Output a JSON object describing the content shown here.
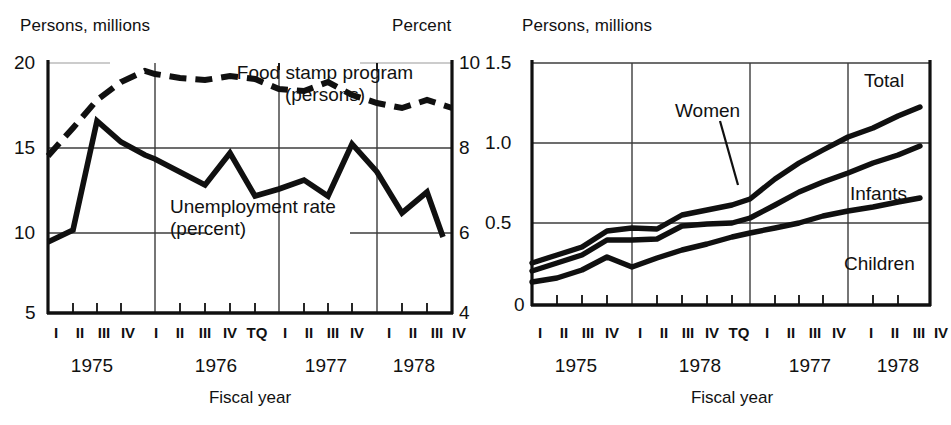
{
  "figure": {
    "background": "#ffffff",
    "ink": "#111111",
    "grid_color": "#4a4a4a"
  },
  "charts": [
    {
      "id": "food-stamp-unemployment",
      "left_axis_caption": "Persons, millions",
      "right_axis_caption": "Percent",
      "xlabel": "Fiscal year",
      "left_ticks": [
        "20",
        "15",
        "10",
        "5"
      ],
      "right_ticks": [
        "10",
        "8",
        "6",
        "4"
      ],
      "quarters": [
        "I",
        "II",
        "III",
        "IV",
        "I",
        "II",
        "III",
        "IV",
        "TQ",
        "I",
        "II",
        "III",
        "IV",
        "I",
        "II",
        "III",
        "IV"
      ],
      "years": [
        "1975",
        "1976",
        "1977",
        "1978"
      ],
      "series_labels": {
        "food_stamp_line1": "Food stamp program",
        "food_stamp_line2": "(persons)",
        "unemployment_line1": "Unemployment rate",
        "unemployment_line2": "(percent)"
      }
    },
    {
      "id": "wic-participants",
      "left_axis_caption": "Persons, millions",
      "xlabel": "Fiscal year",
      "left_ticks": [
        "1.5",
        "1.0",
        "0.5",
        "0"
      ],
      "quarters": [
        "I",
        "II",
        "III",
        "IV",
        "I",
        "II",
        "III",
        "IV",
        "TQ",
        "I",
        "II",
        "III",
        "IV",
        "I",
        "II",
        "III",
        "IV"
      ],
      "years": [
        "1975",
        "1978",
        "1977",
        "1978"
      ],
      "series_labels": {
        "total": "Total",
        "women": "Women",
        "infants": "Infants",
        "children": "Children"
      }
    }
  ],
  "chart_data": [
    {
      "type": "line",
      "title": "",
      "xlabel": "Fiscal year",
      "ylabel": "Persons, millions",
      "y2label": "Percent",
      "ylim": [
        5,
        20
      ],
      "y2lim": [
        4,
        10
      ],
      "yticks": [
        5,
        10,
        15,
        20
      ],
      "y2ticks": [
        4,
        6,
        8,
        10
      ],
      "grid": true,
      "legend": "inline-annotations",
      "x": [
        "I 1975",
        "II 1975",
        "III 1975",
        "IV 1975",
        "I 1976",
        "II 1976",
        "III 1976",
        "IV 1976",
        "TQ",
        "I 1977",
        "II 1977",
        "III 1977",
        "IV 1977",
        "I 1978",
        "II 1978",
        "III 1978",
        "IV 1978"
      ],
      "series": [
        {
          "name": "Food stamp program (persons)",
          "axis": "left",
          "units": "millions of persons",
          "style": "dashed",
          "values": [
            14.4,
            16.2,
            18.6,
            19.4,
            18.7,
            18.6,
            18.9,
            18.5,
            17.5,
            17.4,
            17.9,
            17.1,
            16.4,
            16.0,
            16.6,
            16.5,
            16.0
          ]
        },
        {
          "name": "Unemployment rate (percent)",
          "axis": "right",
          "units": "percent",
          "style": "solid",
          "values": [
            5.7,
            6.0,
            8.6,
            8.4,
            8.1,
            7.8,
            8.3,
            7.5,
            7.6,
            7.4,
            8.2,
            7.1,
            6.9,
            6.3,
            6.6,
            5.9,
            null
          ]
        }
      ]
    },
    {
      "type": "line",
      "title": "",
      "xlabel": "Fiscal year",
      "ylabel": "Persons, millions",
      "ylim": [
        0,
        1.5
      ],
      "yticks": [
        0,
        0.5,
        1.0,
        1.5
      ],
      "grid": true,
      "legend": "inline-annotations",
      "x": [
        "I 1975",
        "II 1975",
        "III 1975",
        "IV 1975",
        "I 1976",
        "II 1976",
        "III 1976",
        "IV 1976",
        "TQ",
        "I 1977",
        "II 1977",
        "III 1977",
        "IV 1977",
        "I 1978",
        "II 1978",
        "III 1978",
        "IV 1978"
      ],
      "series": [
        {
          "name": "Total",
          "units": "millions of persons",
          "style": "solid",
          "values": [
            0.26,
            0.31,
            0.36,
            0.46,
            0.48,
            0.47,
            0.56,
            0.59,
            0.62,
            0.66,
            0.78,
            0.88,
            0.96,
            1.04,
            1.1,
            1.17,
            1.23
          ]
        },
        {
          "name": "Women",
          "units": "millions of persons",
          "style": "solid",
          "values": [
            0.21,
            0.26,
            0.31,
            0.4,
            0.4,
            0.41,
            0.49,
            0.5,
            0.51,
            0.54,
            0.62,
            0.7,
            0.76,
            0.82,
            0.88,
            0.93,
            0.99
          ]
        },
        {
          "name": "Infants",
          "units": "millions of persons",
          "style": "solid",
          "values": [
            0.14,
            0.17,
            0.22,
            0.3,
            0.24,
            0.29,
            0.34,
            0.38,
            0.42,
            0.45,
            0.48,
            0.51,
            0.55,
            0.58,
            0.61,
            0.64,
            0.66
          ]
        },
        {
          "name": "Children",
          "units": "millions of persons",
          "style": "annotation-only",
          "values": []
        }
      ]
    }
  ]
}
